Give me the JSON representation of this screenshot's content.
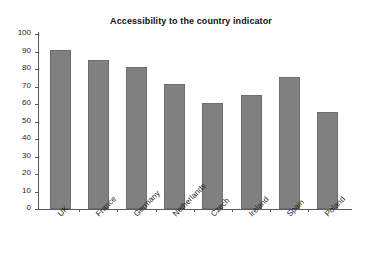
{
  "top_sliver_text": "",
  "chart_data": {
    "type": "bar",
    "title": "Accessibility to the country indicator",
    "xlabel": "",
    "ylabel": "",
    "ylim": [
      0,
      100
    ],
    "yticks": [
      0,
      10,
      20,
      30,
      40,
      50,
      60,
      70,
      80,
      90,
      100
    ],
    "grid": false,
    "legend": false,
    "bar_color": "#808080",
    "bar_edge_color": "#6e6e6e",
    "axis_color": "#5a5a5a",
    "xtick_label_rotation": -45,
    "categories": [
      "UK",
      "France",
      "Germany",
      "Netherlands",
      "Czech",
      "Ireland",
      "Spain",
      "Poland"
    ],
    "values": [
      91,
      85,
      81,
      71.5,
      60.5,
      65,
      75.5,
      55.5
    ]
  }
}
